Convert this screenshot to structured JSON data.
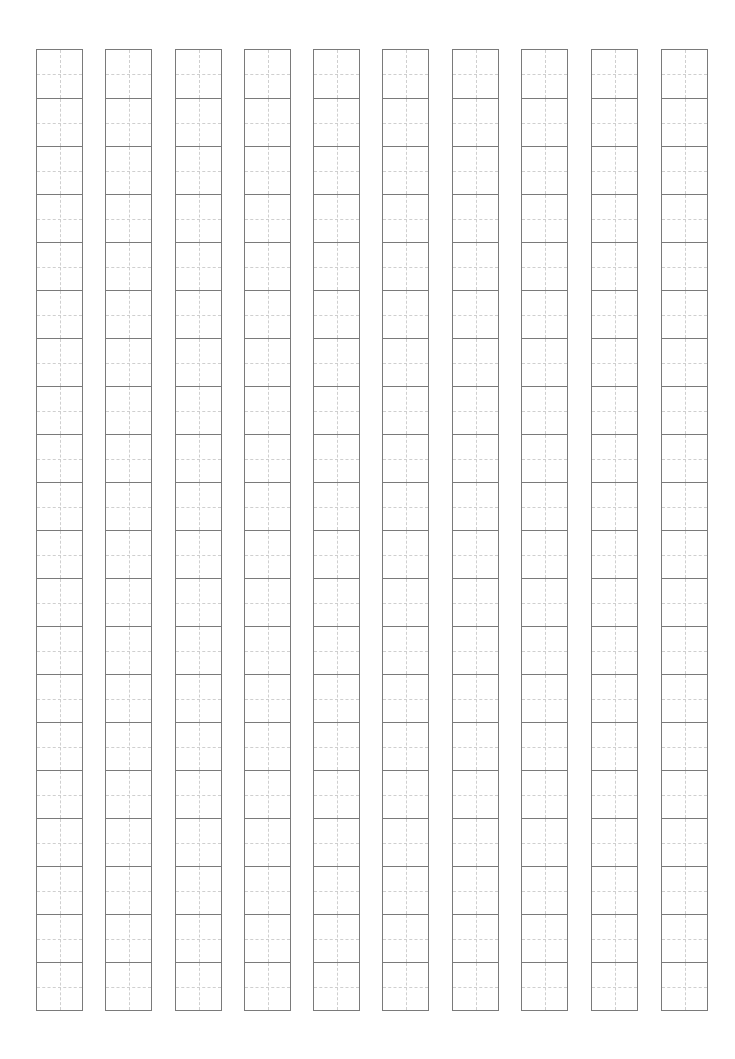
{
  "sheet": {
    "type": "tianzige-practice-grid",
    "columns": 10,
    "rows_per_column": 20,
    "column_lefts": [
      36,
      105,
      175,
      244,
      313,
      382,
      452,
      521,
      591,
      661
    ],
    "grid_top": 49,
    "cell_width": 47,
    "cell_height": 48,
    "colors": {
      "outer_line": "#7a7a7a",
      "guide_line": "#cfcfcf",
      "background": "#ffffff"
    }
  }
}
